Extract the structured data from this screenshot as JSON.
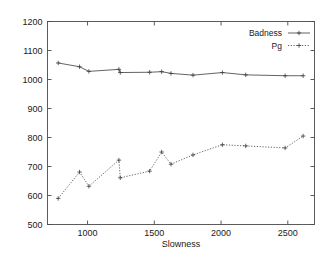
{
  "chart_data": {
    "type": "line",
    "title": "",
    "xlabel": "Slowness",
    "ylabel": "",
    "xlim": [
      700,
      2700
    ],
    "ylim": [
      500,
      1200
    ],
    "grid": false,
    "legend_position": "top-right-inside",
    "xticks": [
      1000,
      1500,
      2000,
      2500
    ],
    "xtick_labels": [
      "1000",
      "1500",
      "2000",
      "2500"
    ],
    "yticks": [
      500,
      600,
      700,
      800,
      900,
      1000,
      1100,
      1200
    ],
    "ytick_labels": [
      "500",
      "600",
      "700",
      "800",
      "900",
      "1000",
      "1100",
      "1200"
    ],
    "series": [
      {
        "name": "Badness",
        "linestyle": "solid",
        "marker": "plus",
        "color": "#3c3c3c",
        "points": [
          [
            780,
            1057
          ],
          [
            940,
            1044
          ],
          [
            1010,
            1028
          ],
          [
            1235,
            1035
          ],
          [
            1245,
            1024
          ],
          [
            1465,
            1025
          ],
          [
            1555,
            1027
          ],
          [
            1625,
            1021
          ],
          [
            1790,
            1015
          ],
          [
            2010,
            1024
          ],
          [
            2185,
            1016
          ],
          [
            2480,
            1013
          ],
          [
            2615,
            1013
          ]
        ]
      },
      {
        "name": "Pg",
        "linestyle": "dotted",
        "marker": "plus",
        "color": "#3c3c3c",
        "points": [
          [
            780,
            590
          ],
          [
            940,
            681
          ],
          [
            1010,
            632
          ],
          [
            1235,
            722
          ],
          [
            1245,
            661
          ],
          [
            1465,
            684
          ],
          [
            1555,
            750
          ],
          [
            1625,
            708
          ],
          [
            1790,
            740
          ],
          [
            2010,
            775
          ],
          [
            2185,
            771
          ],
          [
            2480,
            764
          ],
          [
            2615,
            805
          ]
        ]
      }
    ]
  },
  "legend": {
    "entries": [
      {
        "label": "Badness"
      },
      {
        "label": "Pg"
      }
    ]
  },
  "axes": {
    "x_title": "Slowness"
  }
}
